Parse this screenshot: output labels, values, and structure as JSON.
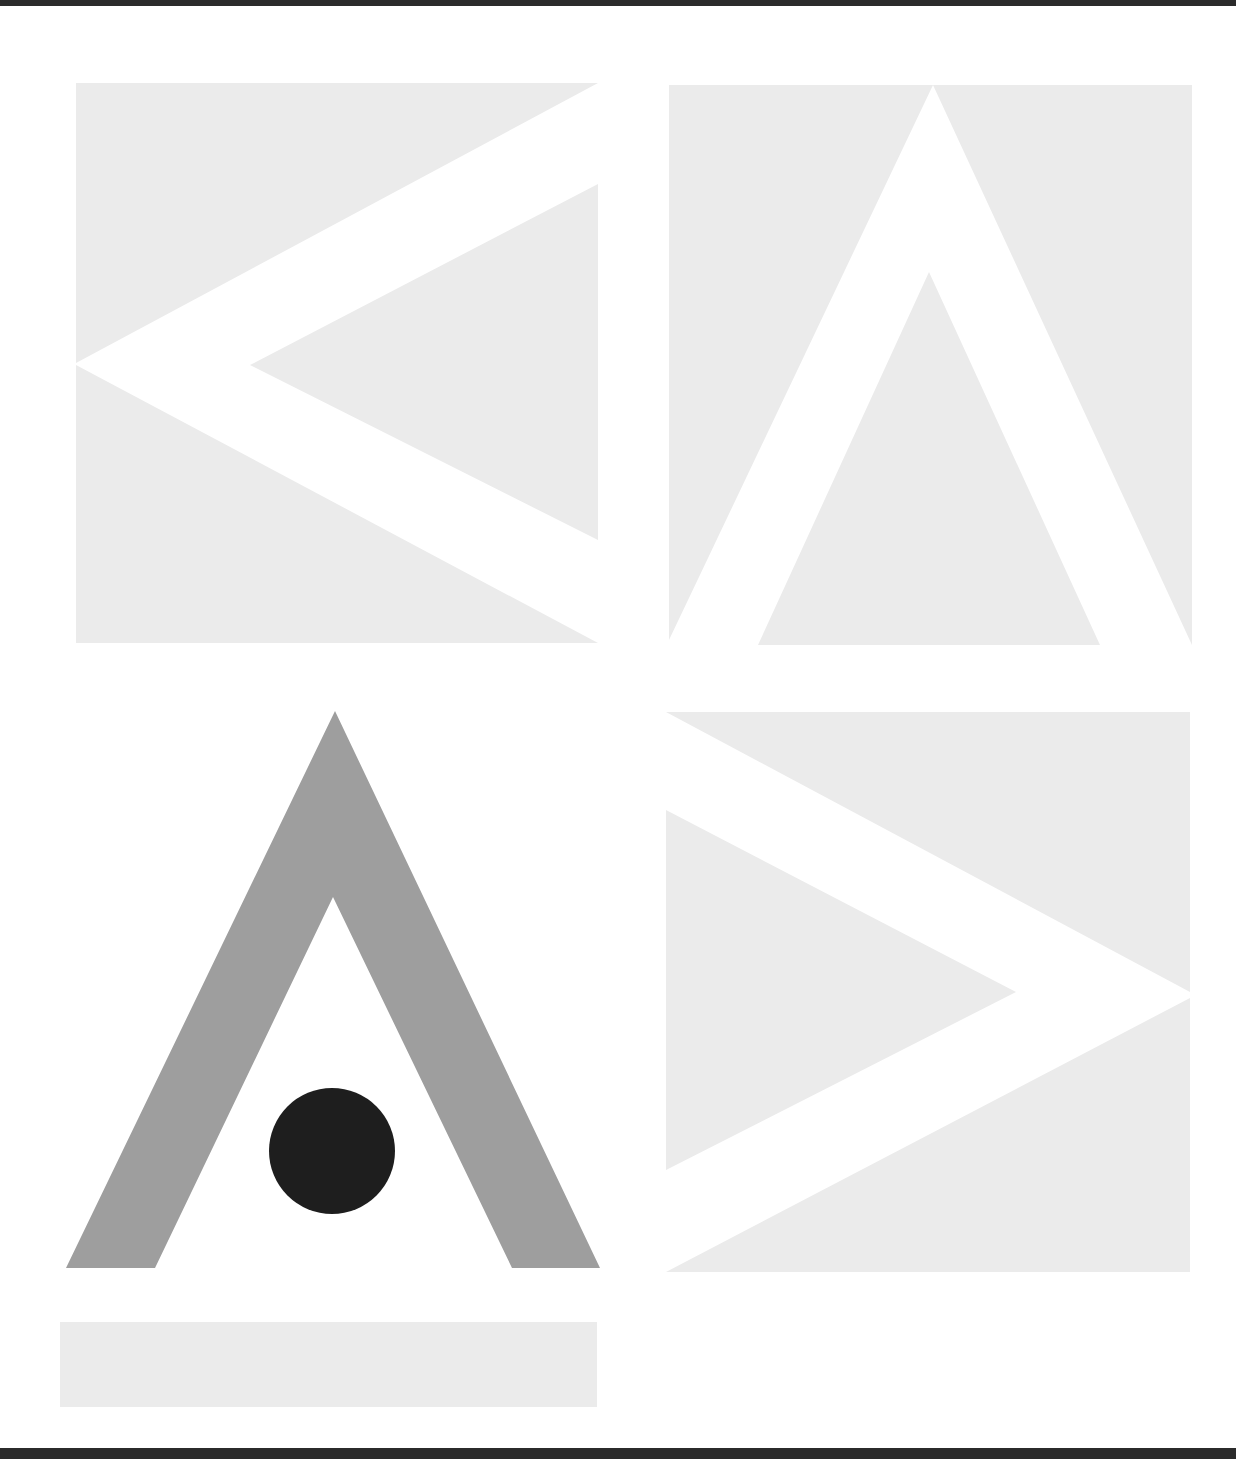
{
  "artwork": {
    "title": "Geometric poster with chevrons and A-shape",
    "colors": {
      "background": "#ffffff",
      "light_panel": "#ebebeb",
      "mid_gray": "#9e9e9e",
      "dot": "#1e1e1e",
      "frame_bar": "#2b2b2b"
    },
    "panels": [
      {
        "id": "top-left",
        "motif": "left-pointing chevron"
      },
      {
        "id": "top-right",
        "motif": "upward-pointing chevron"
      },
      {
        "id": "bottom-left",
        "motif": "gray A-shape with black dot"
      },
      {
        "id": "bottom-right",
        "motif": "right-pointing chevron"
      },
      {
        "id": "bottom-strip",
        "motif": "horizontal light gray bar"
      }
    ]
  }
}
